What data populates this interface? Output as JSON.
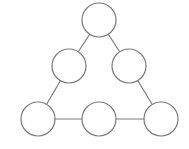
{
  "diagram": {
    "type": "graph",
    "shape": "triangle of circles",
    "style": {
      "stroke_color": "#7a7a7a",
      "fill_color": "#ffffff",
      "background": "#ffffff"
    },
    "nodes": [
      {
        "id": "top",
        "cx": 99,
        "cy": 20,
        "r": 17,
        "label": ""
      },
      {
        "id": "mid-left",
        "cx": 69,
        "cy": 66,
        "r": 17,
        "label": ""
      },
      {
        "id": "mid-right",
        "cx": 129,
        "cy": 66,
        "r": 17,
        "label": ""
      },
      {
        "id": "bottom-left",
        "cx": 38,
        "cy": 119,
        "r": 17,
        "label": ""
      },
      {
        "id": "bottom-middle",
        "cx": 99,
        "cy": 119,
        "r": 17,
        "label": ""
      },
      {
        "id": "bottom-right",
        "cx": 161,
        "cy": 119,
        "r": 17,
        "label": ""
      }
    ],
    "edges": [
      {
        "from": "top",
        "to": "mid-left"
      },
      {
        "from": "top",
        "to": "mid-right"
      },
      {
        "from": "mid-left",
        "to": "bottom-left"
      },
      {
        "from": "mid-right",
        "to": "bottom-right"
      },
      {
        "from": "bottom-left",
        "to": "bottom-middle"
      },
      {
        "from": "bottom-middle",
        "to": "bottom-right"
      }
    ]
  }
}
